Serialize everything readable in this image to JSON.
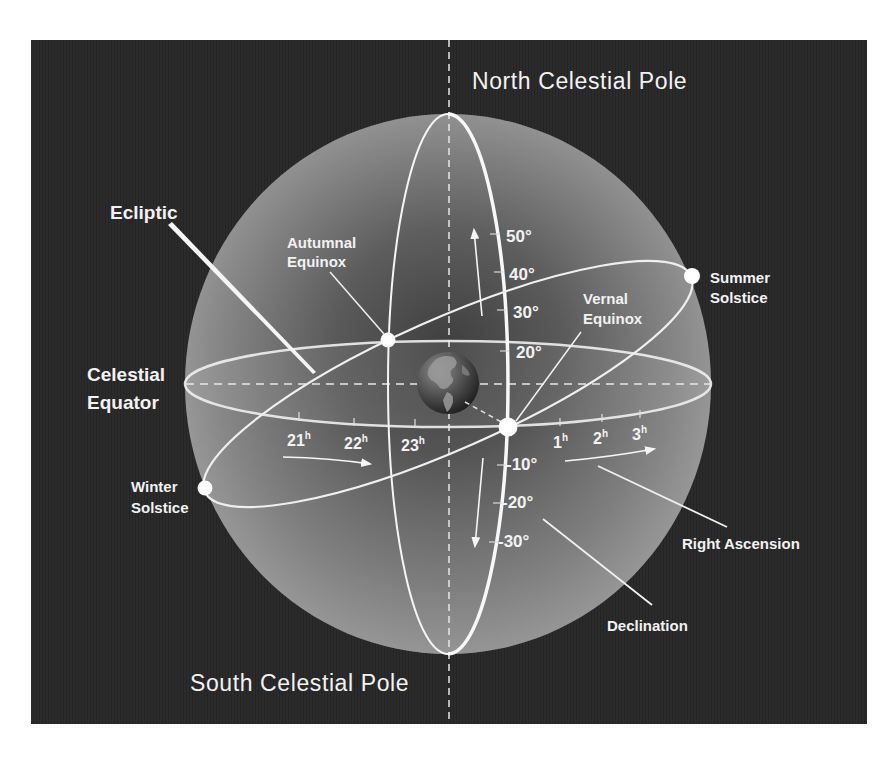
{
  "diagram": {
    "colors": {
      "background": "#ffffff",
      "panel": "#2a2a2a",
      "sphere_light": "#b8b8b8",
      "sphere_dark": "#3a3a3a",
      "line": "#f5f5f5"
    },
    "poles": {
      "north": "North Celestial Pole",
      "south": "South Celestial Pole"
    },
    "labels": {
      "ecliptic": "Ecliptic",
      "celestial_equator_line1": "Celestial",
      "celestial_equator_line2": "Equator",
      "autumnal_equinox_line1": "Autumnal",
      "autumnal_equinox_line2": "Equinox",
      "vernal_equinox_line1": "Vernal",
      "vernal_equinox_line2": "Equinox",
      "summer_solstice_line1": "Summer",
      "summer_solstice_line2": "Solstice",
      "winter_solstice_line1": "Winter",
      "winter_solstice_line2": "Solstice",
      "right_ascension": "Right Ascension",
      "declination": "Declination"
    },
    "declination_ticks": {
      "positive": [
        "50°",
        "40°",
        "30°",
        "20°"
      ],
      "negative": [
        "-10°",
        "-20°",
        "-30°"
      ]
    },
    "right_ascension_ticks": {
      "left": [
        {
          "num": "21",
          "unit": "h"
        },
        {
          "num": "22",
          "unit": "h"
        },
        {
          "num": "23",
          "unit": "h"
        }
      ],
      "right": [
        {
          "num": "1",
          "unit": "h"
        },
        {
          "num": "2",
          "unit": "h"
        },
        {
          "num": "3",
          "unit": "h"
        }
      ]
    },
    "center_object": "earth-globe"
  }
}
